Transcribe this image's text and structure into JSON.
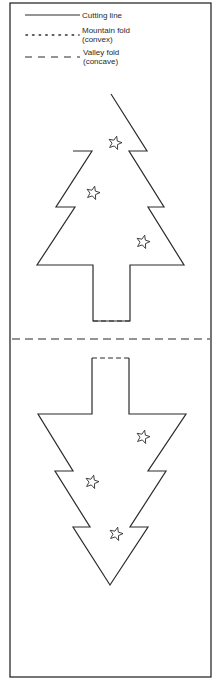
{
  "colors": {
    "line": "#2b2b2b",
    "background": "#ffffff"
  },
  "legend": {
    "items": [
      {
        "style": "solid",
        "label_lines": [
          "Cutting line"
        ]
      },
      {
        "style": "dotted",
        "label_lines": [
          "Mountain fold",
          "(convex)"
        ]
      },
      {
        "style": "dashed",
        "label_lines": [
          "Valley fold",
          "(concave)"
        ]
      }
    ]
  },
  "diagram": {
    "border": {
      "x1": 10,
      "y1": 3,
      "x2": 211,
      "y2": 677
    },
    "center_fold": {
      "style": "dashed",
      "y": 339
    },
    "top_tree": {
      "outline": [
        [
          111,
          94
        ],
        [
          147,
          151
        ],
        [
          129,
          151
        ],
        [
          164,
          207
        ],
        [
          148,
          207
        ],
        [
          184,
          265
        ],
        [
          130,
          265
        ],
        [
          130,
          321
        ],
        [
          93,
          321
        ],
        [
          93,
          265
        ],
        [
          37,
          265
        ],
        [
          75,
          207
        ],
        [
          56,
          207
        ],
        [
          92,
          151
        ],
        [
          73,
          151
        ]
      ],
      "trunk_fold": {
        "style": "dashed",
        "x1": 93,
        "x2": 130,
        "y": 321
      },
      "stars": [
        [
          115,
          143
        ],
        [
          93,
          193
        ],
        [
          143,
          242
        ]
      ]
    },
    "bottom_tree": {
      "outline": [
        [
          92,
          358
        ],
        [
          92,
          414
        ],
        [
          38,
          414
        ],
        [
          73,
          471
        ],
        [
          55,
          471
        ],
        [
          90,
          527
        ],
        [
          73,
          527
        ],
        [
          110,
          585
        ],
        [
          148,
          527
        ],
        [
          130,
          527
        ],
        [
          166,
          471
        ],
        [
          148,
          471
        ],
        [
          186,
          414
        ],
        [
          129,
          414
        ],
        [
          129,
          358
        ]
      ],
      "trunk_fold": {
        "style": "dashed",
        "x1": 92,
        "x2": 129,
        "y": 358
      },
      "stars": [
        [
          143,
          437
        ],
        [
          92,
          482
        ],
        [
          116,
          534
        ]
      ]
    }
  }
}
